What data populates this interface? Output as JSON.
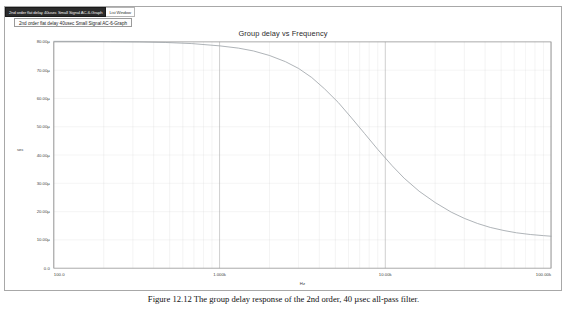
{
  "window": {
    "tabs": [
      {
        "label": "2nd order flat delay 40usec Small Signal AC-6-Graph",
        "active": true
      },
      {
        "label": "List Window",
        "active": false
      }
    ],
    "document_button_label": "2nd order flat delay 40usec Small Signal AC-6-Graph"
  },
  "caption": {
    "text": "Figure 12.12 The group delay response of the 2nd order, 40 µsec all-pass filter."
  },
  "colors": {
    "background": "#ffffff",
    "window_border": "#a8a8a8",
    "active_tab_bg": "#2b2b2b",
    "active_tab_text": "#f2f2f2",
    "plot_frame": "#8e8e8e",
    "gridline": "#cfcfcf",
    "gridline_major": "#9a9a9a",
    "curve": "#9aa0a6",
    "tick_text": "#3f3f3f"
  },
  "chart_data": {
    "type": "line",
    "title": "Group delay vs Frequency",
    "xlabel": "Hz",
    "ylabel": "sec",
    "xscale": "log",
    "yscale": "linear",
    "xlim": [
      100,
      100000
    ],
    "ylim": [
      0,
      8e-05
    ],
    "grid": true,
    "legend": false,
    "xticks": [
      100,
      1000,
      10000,
      100000
    ],
    "xticklabels": [
      "100.0",
      "1.000k",
      "10.00k",
      "100.00k"
    ],
    "yticks": [
      0,
      1e-05,
      2e-05,
      3e-05,
      4e-05,
      5e-05,
      6e-05,
      7e-05,
      8e-05
    ],
    "yticklabels": [
      "0.0",
      "10.00µ",
      "20.00µ",
      "30.00µ",
      "40.00µ",
      "50.00µ",
      "60.00µ",
      "70.00µ",
      "80.00µ"
    ],
    "series": [
      {
        "name": "Group delay",
        "color": "#9aa0a6",
        "x": [
          100,
          150,
          220,
          330,
          470,
          680,
          1000,
          1300,
          1600,
          2000,
          2500,
          3000,
          3600,
          4300,
          5200,
          6200,
          7500,
          9000,
          11000,
          13000,
          16000,
          20000,
          25000,
          30000,
          36000,
          43000,
          52000,
          62000,
          75000,
          90000,
          100000
        ],
        "y": [
          8.02e-05,
          8.02e-05,
          8.01e-05,
          8e-05,
          7.98e-05,
          7.94e-05,
          7.86e-05,
          7.78e-05,
          7.68e-05,
          7.52e-05,
          7.3e-05,
          7.06e-05,
          6.74e-05,
          6.34e-05,
          5.86e-05,
          5.34e-05,
          4.76e-05,
          4.2e-05,
          3.62e-05,
          3.18e-05,
          2.72e-05,
          2.32e-05,
          1.98e-05,
          1.76e-05,
          1.58e-05,
          1.44e-05,
          1.33e-05,
          1.25e-05,
          1.19e-05,
          1.15e-05,
          1.13e-05
        ]
      }
    ]
  }
}
